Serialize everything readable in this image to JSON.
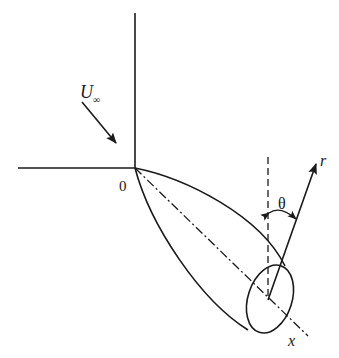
{
  "diagram": {
    "labels": {
      "freestream": "U",
      "freestream_sub": "∞",
      "origin": "0",
      "angle": "θ",
      "radial": "r",
      "axis": "x"
    },
    "colors": {
      "stroke": "#1a1a1a",
      "background": "#ffffff"
    }
  }
}
